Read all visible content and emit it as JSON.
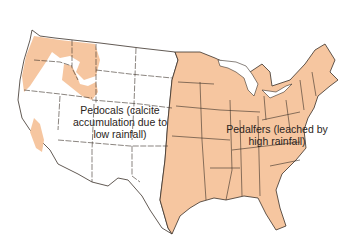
{
  "map": {
    "title": "Soil types of the contiguous United States",
    "colors": {
      "pedalfer_fill": "#f6c6a0",
      "pedocal_fill": "#ffffff",
      "border": "#3a3028",
      "background": "#ffffff"
    },
    "regions": [
      {
        "id": "pedocals",
        "line1": "Pedocals (calcite",
        "line2": "accumulation due to",
        "line3": "low rainfall)"
      },
      {
        "id": "pedalfers",
        "line1": "Pedalfers (leached by",
        "line2": "high rainfall)"
      }
    ]
  }
}
